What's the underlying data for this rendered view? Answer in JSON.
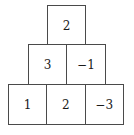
{
  "figure": {
    "name": "number-pyramid",
    "shape": "pyramid",
    "row_count": 3,
    "background_color": "#ffffff",
    "border_color": "#4a4a4a",
    "text_color": "#1a1a1a"
  },
  "chart_data": {
    "type": "table",
    "title": "",
    "xlabel": "",
    "ylabel": "",
    "layout": "pyramid",
    "rows": [
      {
        "index": 0,
        "position": "top",
        "cells": [
          "2"
        ],
        "values": [
          2
        ]
      },
      {
        "index": 1,
        "position": "middle",
        "cells": [
          "3",
          "−1"
        ],
        "values": [
          3,
          -1
        ]
      },
      {
        "index": 2,
        "position": "bottom",
        "cells": [
          "1",
          "2",
          "−3"
        ],
        "values": [
          1,
          2,
          -3
        ]
      }
    ]
  }
}
